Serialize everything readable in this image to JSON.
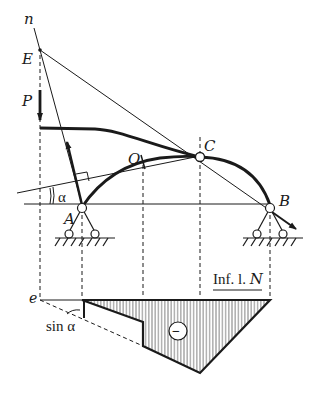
{
  "figure": {
    "colors": {
      "ink": "#1a1a1a",
      "background": "#ffffff"
    }
  },
  "labels": {
    "n": "n",
    "E": "E",
    "P": "P",
    "O": "O",
    "C": "C",
    "A": "A",
    "B": "B",
    "alpha": "α",
    "e": "e",
    "sin_alpha": "sin α",
    "influence_title_prefix": "Inf. l. ",
    "influence_title_var": "N",
    "sign": "−"
  },
  "points": {
    "E": [
      40,
      50
    ],
    "A": [
      82,
      210
    ],
    "O": [
      143,
      162
    ],
    "C": [
      200,
      132
    ],
    "B": [
      270,
      210
    ]
  },
  "influence_line": {
    "baseline_y": 300,
    "e_x": 40,
    "A_x": 82,
    "O_x": 143,
    "C_x": 200,
    "B_x": 270,
    "ordinates": {
      "at_A": 0,
      "O_left": 22,
      "O_right": 46,
      "at_C": 73,
      "at_B": 0
    },
    "sign": "negative"
  }
}
